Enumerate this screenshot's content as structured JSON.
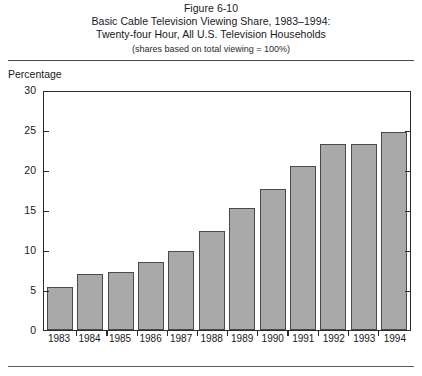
{
  "figure": {
    "number_label": "Figure 6-10",
    "title_line1": "Basic Cable Television Viewing Share, 1983–1994:",
    "title_line2": "Twenty-four Hour, All U.S. Television Households",
    "subtitle": "(shares based on total viewing = 100%)"
  },
  "chart_data": {
    "type": "bar",
    "title": "Basic Cable Television Viewing Share, 1983–1994: Twenty-four Hour, All U.S. Television Households",
    "subtitle": "(shares based on total viewing = 100%)",
    "xlabel": "",
    "ylabel": "Percentage",
    "ylim": [
      0,
      30
    ],
    "yticks": [
      0,
      5,
      10,
      15,
      20,
      25,
      30
    ],
    "ytick_labels": [
      "0",
      "5",
      "10",
      "15",
      "20",
      "25",
      "30"
    ],
    "grid": false,
    "legend": null,
    "categories": [
      "1983",
      "1984",
      "1985",
      "1986",
      "1987",
      "1988",
      "1989",
      "1990",
      "1991",
      "1992",
      "1993",
      "1994"
    ],
    "values": [
      5.4,
      7.0,
      7.2,
      8.5,
      9.9,
      12.4,
      15.2,
      17.6,
      20.5,
      23.2,
      23.3,
      24.8
    ],
    "bar_fill_color": "#a9a9a9",
    "bar_edge_color": "#4a4a4a",
    "axis_color": "#2b2b2b"
  }
}
